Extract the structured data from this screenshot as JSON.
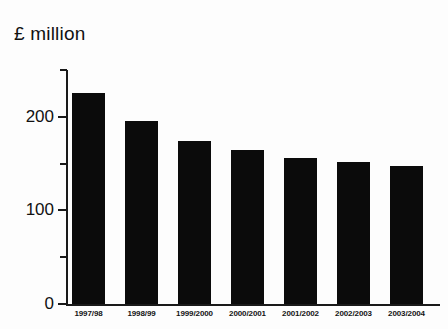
{
  "chart_data": {
    "type": "bar",
    "title": "£ million",
    "xlabel": "",
    "ylabel": "",
    "ylim": [
      0,
      250
    ],
    "grid": false,
    "legend": null,
    "categories": [
      "1997/98",
      "1998/99",
      "1999/2000",
      "2000/2001",
      "2001/2002",
      "2002/2003",
      "2003/2004"
    ],
    "values": [
      225,
      196,
      174,
      164,
      156,
      152,
      147
    ],
    "y_ticks_major": [
      0,
      100,
      200
    ],
    "y_tick_labels": [
      "0",
      "100",
      "200"
    ],
    "y_ticks_minor": [
      50,
      150,
      250
    ],
    "bar_color": "#0b0b0b",
    "axis_color": "#1a1a1a",
    "background_color": "#fdfdfd"
  }
}
